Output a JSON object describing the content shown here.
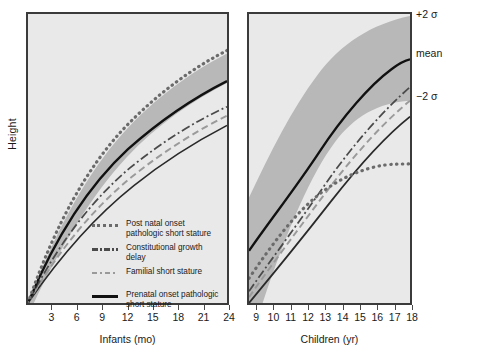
{
  "figure": {
    "ylabel": "Height"
  },
  "panels": {
    "infants": {
      "axis_title": "Infants (mo)",
      "tick_labels": [
        "3",
        "6",
        "9",
        "12",
        "15",
        "18",
        "21",
        "24"
      ]
    },
    "children": {
      "axis_title": "Children (yr)",
      "tick_labels": [
        "9",
        "10",
        "11",
        "12",
        "13",
        "14",
        "15",
        "16",
        "17",
        "18"
      ]
    }
  },
  "annotations": {
    "plus_two_sigma": "+2 σ",
    "mean": "mean",
    "minus_two_sigma": "−2 σ"
  },
  "legend": {
    "items": [
      {
        "style": "dotted",
        "label": "Post natal onset pathologic short stature"
      },
      {
        "style": "dash-dot",
        "label": "Constitutional growth delay"
      },
      {
        "style": "dashed",
        "label": "Familial short stature"
      },
      {
        "style": "solid",
        "label": "Prenatal onset pathologic short stature"
      }
    ]
  },
  "colors": {
    "panel_background": "#e9e9e9",
    "reference_band": "#b8b8b8",
    "panel_border": "#3b3b3b",
    "curve_dotted": "#6b6b6b",
    "curve_dashdot": "#4a4a4a",
    "curve_dashed": "#9a9a9a",
    "curve_solid": "#111111",
    "text": "#1a1a1a"
  },
  "chart_data": {
    "type": "line",
    "title": "",
    "ylabel": "Height",
    "grid": false,
    "legend_position": "inside-lower-left-of-infants-panel",
    "panels": [
      {
        "name": "infants",
        "xlabel": "Infants (mo)",
        "xticks": [
          3,
          6,
          9,
          12,
          15,
          18,
          21,
          24
        ],
        "xlim": [
          0,
          24
        ],
        "reference_band": {
          "name": "±2 σ normal range",
          "x": [
            0,
            3,
            6,
            9,
            12,
            15,
            18,
            21,
            24
          ],
          "upper": [
            0,
            26,
            45,
            59,
            70,
            78,
            85,
            90,
            94
          ],
          "lower": [
            0,
            17,
            31,
            42,
            51,
            58,
            64,
            69,
            73
          ]
        },
        "series": [
          {
            "name": "Post natal onset pathologic short stature",
            "style": "dotted",
            "x": [
              0,
              3,
              6,
              9,
              12,
              15,
              18,
              21,
              24
            ],
            "y": [
              0,
              27,
              47,
              62,
              73,
              82,
              89,
              94,
              98
            ]
          },
          {
            "name": "Prenatal onset pathologic short stature",
            "style": "solid",
            "x": [
              0,
              3,
              6,
              9,
              12,
              15,
              18,
              21,
              24
            ],
            "y": [
              0,
              23,
              41,
              55,
              65,
              73,
              80,
              85,
              89
            ]
          },
          {
            "name": "Constitutional growth delay",
            "style": "dash-dot",
            "x": [
              0,
              3,
              6,
              9,
              12,
              15,
              18,
              21,
              24
            ],
            "y": [
              0,
              20,
              36,
              48,
              57,
              65,
              71,
              76,
              80
            ]
          },
          {
            "name": "Familial short stature",
            "style": "dashed",
            "x": [
              0,
              3,
              6,
              9,
              12,
              15,
              18,
              21,
              24
            ],
            "y": [
              0,
              18,
              33,
              44,
              53,
              60,
              66,
              71,
              75
            ]
          },
          {
            "name": "Lower normal limit",
            "style": "solid-thin",
            "x": [
              0,
              3,
              6,
              9,
              12,
              15,
              18,
              21,
              24
            ],
            "y": [
              0,
              15,
              28,
              38,
              46,
              53,
              59,
              64,
              68
            ]
          }
        ]
      },
      {
        "name": "children",
        "xlabel": "Children (yr)",
        "xticks": [
          9,
          10,
          11,
          12,
          13,
          14,
          15,
          16,
          17,
          18
        ],
        "xlim": [
          8.5,
          18
        ],
        "reference_band": {
          "name": "±2 σ normal range",
          "x": [
            8.5,
            10,
            11,
            12,
            13,
            14,
            15,
            16,
            17,
            18
          ],
          "upper": [
            38,
            55,
            66,
            77,
            86,
            93,
            97,
            99,
            100,
            100
          ],
          "lower": [
            2,
            10,
            17,
            25,
            34,
            44,
            54,
            62,
            67,
            70
          ]
        },
        "series": [
          {
            "name": "Mean (reference)",
            "style": "solid",
            "x": [
              8.5,
              10,
              11,
              12,
              13,
              14,
              15,
              16,
              17,
              18
            ],
            "y": [
              18,
              31,
              40,
              50,
              61,
              71,
              79,
              84,
              86,
              87
            ]
          },
          {
            "name": "Post natal onset pathologic short stature",
            "style": "dotted",
            "x": [
              8.5,
              10,
              11,
              12,
              13,
              14,
              15,
              16,
              17,
              18
            ],
            "y": [
              8,
              21,
              30,
              38,
              44,
              47,
              48,
              49,
              49,
              49
            ]
          },
          {
            "name": "Constitutional growth delay",
            "style": "dash-dot",
            "x": [
              8.5,
              10,
              11,
              12,
              13,
              14,
              15,
              16,
              17,
              18
            ],
            "y": [
              4,
              15,
              23,
              31,
              39,
              48,
              58,
              68,
              75,
              78
            ]
          },
          {
            "name": "Familial short stature",
            "style": "dashed",
            "x": [
              8.5,
              10,
              11,
              12,
              13,
              14,
              15,
              16,
              17,
              18
            ],
            "y": [
              2,
              12,
              19,
              27,
              35,
              43,
              52,
              60,
              66,
              69
            ]
          },
          {
            "name": "Prenatal onset pathologic short stature",
            "style": "solid-thin",
            "x": [
              8.5,
              10,
              11,
              12,
              13,
              14,
              15,
              16,
              17,
              18
            ],
            "y": [
              0,
              7,
              13,
              20,
              27,
              35,
              43,
              51,
              57,
              60
            ]
          }
        ]
      }
    ]
  }
}
